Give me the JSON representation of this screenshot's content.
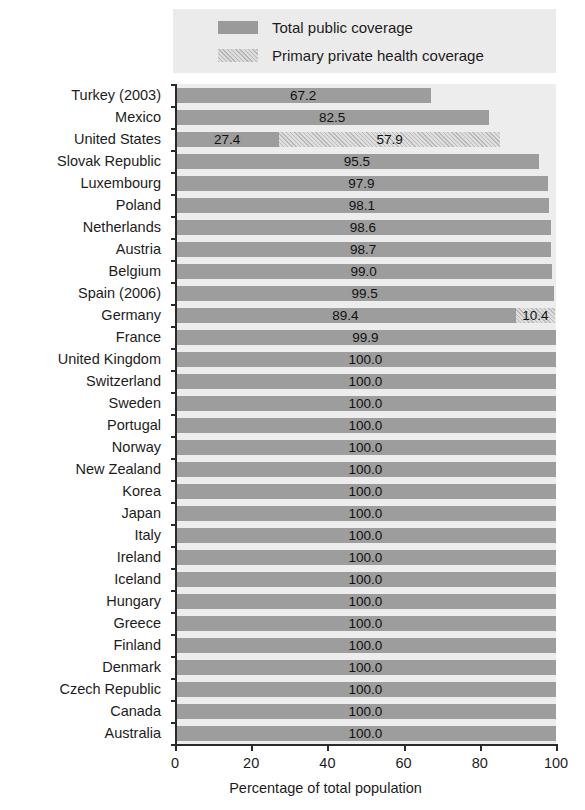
{
  "legend": {
    "items": [
      {
        "label": "Total public coverage",
        "swatch": "solid-gray-swatch",
        "color": "#9a9a9a"
      },
      {
        "label": "Primary private health coverage",
        "swatch": "hatched-gray-swatch",
        "color": "#dcdcdc"
      }
    ]
  },
  "axis": {
    "title": "Percentage of total population",
    "ticks": [
      "0",
      "20",
      "40",
      "60",
      "80",
      "100"
    ]
  },
  "chart_data": {
    "type": "bar",
    "orientation": "horizontal",
    "stacked": true,
    "title": "",
    "subtitle": "",
    "xlabel": "Percentage of total population",
    "ylabel": "",
    "xlim": [
      0,
      100
    ],
    "xticks": [
      0,
      20,
      40,
      60,
      80,
      100
    ],
    "grid": false,
    "legend_position": "top",
    "categories": [
      "Turkey (2003)",
      "Mexico",
      "United States",
      "Slovak Republic",
      "Luxembourg",
      "Poland",
      "Netherlands",
      "Austria",
      "Belgium",
      "Spain (2006)",
      "Germany",
      "France",
      "United Kingdom",
      "Switzerland",
      "Sweden",
      "Portugal",
      "Norway",
      "New Zealand",
      "Korea",
      "Japan",
      "Italy",
      "Ireland",
      "Iceland",
      "Hungary",
      "Greece",
      "Finland",
      "Denmark",
      "Czech Republic",
      "Canada",
      "Australia"
    ],
    "series": [
      {
        "name": "Total public coverage",
        "values": [
          67.2,
          82.5,
          27.4,
          95.5,
          97.9,
          98.1,
          98.6,
          98.7,
          99.0,
          99.5,
          89.4,
          99.9,
          100.0,
          100.0,
          100.0,
          100.0,
          100.0,
          100.0,
          100.0,
          100.0,
          100.0,
          100.0,
          100.0,
          100.0,
          100.0,
          100.0,
          100.0,
          100.0,
          100.0,
          100.0
        ]
      },
      {
        "name": "Primary private health coverage",
        "values": [
          0,
          0,
          57.9,
          0,
          0,
          0,
          0,
          0,
          0,
          0,
          10.4,
          0,
          0,
          0,
          0,
          0,
          0,
          0,
          0,
          0,
          0,
          0,
          0,
          0,
          0,
          0,
          0,
          0,
          0,
          0
        ]
      }
    ],
    "data_labels": {
      "Turkey (2003)": {
        "public": "67.2",
        "private": ""
      },
      "Mexico": {
        "public": "82.5",
        "private": ""
      },
      "United States": {
        "public": "27.4",
        "private": "57.9"
      },
      "Slovak Republic": {
        "public": "95.5",
        "private": ""
      },
      "Luxembourg": {
        "public": "97.9",
        "private": ""
      },
      "Poland": {
        "public": "98.1",
        "private": ""
      },
      "Netherlands": {
        "public": "98.6",
        "private": ""
      },
      "Austria": {
        "public": "98.7",
        "private": ""
      },
      "Belgium": {
        "public": "99.0",
        "private": ""
      },
      "Spain (2006)": {
        "public": "99.5",
        "private": ""
      },
      "Germany": {
        "public": "89.4",
        "private": "10.4"
      },
      "France": {
        "public": "99.9",
        "private": ""
      },
      "United Kingdom": {
        "public": "100.0",
        "private": ""
      },
      "Switzerland": {
        "public": "100.0",
        "private": ""
      },
      "Sweden": {
        "public": "100.0",
        "private": ""
      },
      "Portugal": {
        "public": "100.0",
        "private": ""
      },
      "Norway": {
        "public": "100.0",
        "private": ""
      },
      "New Zealand": {
        "public": "100.0",
        "private": ""
      },
      "Korea": {
        "public": "100.0",
        "private": ""
      },
      "Japan": {
        "public": "100.0",
        "private": ""
      },
      "Italy": {
        "public": "100.0",
        "private": ""
      },
      "Ireland": {
        "public": "100.0",
        "private": ""
      },
      "Iceland": {
        "public": "100.0",
        "private": ""
      },
      "Hungary": {
        "public": "100.0",
        "private": ""
      },
      "Greece": {
        "public": "100.0",
        "private": ""
      },
      "Finland": {
        "public": "100.0",
        "private": ""
      },
      "Denmark": {
        "public": "100.0",
        "private": ""
      },
      "Czech Republic": {
        "public": "100.0",
        "private": ""
      },
      "Canada": {
        "public": "100.0",
        "private": ""
      },
      "Australia": {
        "public": "100.0",
        "private": ""
      }
    }
  }
}
